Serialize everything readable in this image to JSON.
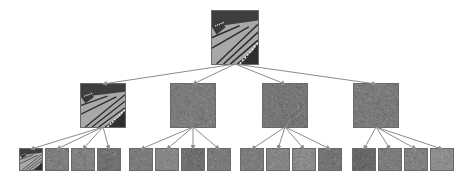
{
  "diagram": {
    "type": "tree",
    "description_visible_text": "",
    "arrow_color": "#8c8c8c",
    "levels": 3,
    "root": {
      "id": "root",
      "kind": "butterfly-image",
      "x": 211,
      "y": 10,
      "w": 48,
      "h": 55,
      "tone": "#8a8a8a"
    },
    "level1": [
      {
        "id": "L1-0",
        "kind": "butterfly-image",
        "x": 80,
        "y": 83,
        "w": 46,
        "h": 45,
        "tone": "#8c8c8c"
      },
      {
        "id": "L1-1",
        "kind": "noise-texture",
        "x": 170,
        "y": 83,
        "w": 46,
        "h": 45,
        "tone": "#7b7b7b"
      },
      {
        "id": "L1-2",
        "kind": "noise-texture",
        "x": 262,
        "y": 83,
        "w": 46,
        "h": 45,
        "tone": "#767676"
      },
      {
        "id": "L1-3",
        "kind": "noise-texture",
        "x": 353,
        "y": 83,
        "w": 46,
        "h": 45,
        "tone": "#7a7a7a"
      }
    ],
    "level2": [
      {
        "id": "L2-0",
        "parent": "L1-0",
        "kind": "butterfly-image",
        "x": 19,
        "y": 148,
        "w": 24,
        "h": 23,
        "tone": "#8a8a8a"
      },
      {
        "id": "L2-1",
        "parent": "L1-0",
        "kind": "noise-texture",
        "x": 45,
        "y": 148,
        "w": 24,
        "h": 23,
        "tone": "#7e7e7e"
      },
      {
        "id": "L2-2",
        "parent": "L1-0",
        "kind": "noise-texture",
        "x": 71,
        "y": 148,
        "w": 24,
        "h": 23,
        "tone": "#808080"
      },
      {
        "id": "L2-3",
        "parent": "L1-0",
        "kind": "noise-texture",
        "x": 97,
        "y": 148,
        "w": 24,
        "h": 23,
        "tone": "#717171"
      },
      {
        "id": "L2-4",
        "parent": "L1-1",
        "kind": "noise-texture",
        "x": 129,
        "y": 148,
        "w": 24,
        "h": 23,
        "tone": "#7b7b7b"
      },
      {
        "id": "L2-5",
        "parent": "L1-1",
        "kind": "noise-texture",
        "x": 155,
        "y": 148,
        "w": 24,
        "h": 23,
        "tone": "#868686"
      },
      {
        "id": "L2-6",
        "parent": "L1-1",
        "kind": "noise-texture",
        "x": 181,
        "y": 148,
        "w": 24,
        "h": 23,
        "tone": "#6e6e6e"
      },
      {
        "id": "L2-7",
        "parent": "L1-1",
        "kind": "noise-texture",
        "x": 207,
        "y": 148,
        "w": 24,
        "h": 23,
        "tone": "#7a7a7a"
      },
      {
        "id": "L2-8",
        "parent": "L1-2",
        "kind": "noise-texture",
        "x": 240,
        "y": 148,
        "w": 24,
        "h": 23,
        "tone": "#7c7c7c"
      },
      {
        "id": "L2-9",
        "parent": "L1-2",
        "kind": "noise-texture",
        "x": 266,
        "y": 148,
        "w": 24,
        "h": 23,
        "tone": "#858585"
      },
      {
        "id": "L2-10",
        "parent": "L1-2",
        "kind": "noise-texture",
        "x": 292,
        "y": 148,
        "w": 24,
        "h": 23,
        "tone": "#8a8a8a"
      },
      {
        "id": "L2-11",
        "parent": "L1-2",
        "kind": "noise-texture",
        "x": 318,
        "y": 148,
        "w": 24,
        "h": 23,
        "tone": "#747474"
      },
      {
        "id": "L2-12",
        "parent": "L1-3",
        "kind": "noise-texture",
        "x": 352,
        "y": 148,
        "w": 24,
        "h": 23,
        "tone": "#676767"
      },
      {
        "id": "L2-13",
        "parent": "L1-3",
        "kind": "noise-texture",
        "x": 378,
        "y": 148,
        "w": 24,
        "h": 23,
        "tone": "#7c7c7c"
      },
      {
        "id": "L2-14",
        "parent": "L1-3",
        "kind": "noise-texture",
        "x": 404,
        "y": 148,
        "w": 24,
        "h": 23,
        "tone": "#818181"
      },
      {
        "id": "L2-15",
        "parent": "L1-3",
        "kind": "noise-texture",
        "x": 430,
        "y": 148,
        "w": 24,
        "h": 23,
        "tone": "#8d8d8d"
      }
    ]
  }
}
